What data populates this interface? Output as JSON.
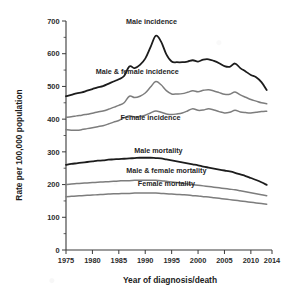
{
  "chart_data": {
    "type": "line",
    "title": "",
    "xlabel": "Year of diagnosis/death",
    "ylabel": "Rate per 100,000 population",
    "xlim": [
      1975,
      2014
    ],
    "ylim": [
      0,
      700
    ],
    "yticks": [
      0,
      100,
      200,
      300,
      400,
      500,
      600,
      700
    ],
    "ytick_minor_step": 50,
    "xticks": [
      1975,
      1980,
      1985,
      1990,
      1995,
      2000,
      2005,
      2010,
      2014
    ],
    "grid": false,
    "legend": "inline-annotations",
    "x": [
      1975,
      1976,
      1977,
      1978,
      1979,
      1980,
      1981,
      1982,
      1983,
      1984,
      1985,
      1986,
      1987,
      1988,
      1989,
      1990,
      1991,
      1992,
      1993,
      1994,
      1995,
      1996,
      1997,
      1998,
      1999,
      2000,
      2001,
      2002,
      2003,
      2004,
      2005,
      2006,
      2007,
      2008,
      2009,
      2010,
      2011,
      2012,
      2013
    ],
    "series": [
      {
        "name": "Male incidence",
        "color": "#1c1c1c",
        "width": 1.8,
        "label_x": 1991.2,
        "label_y": 690,
        "values": [
          470,
          474,
          479,
          482,
          487,
          492,
          497,
          501,
          508,
          515,
          522,
          532,
          561,
          556,
          566,
          585,
          620,
          655,
          637,
          598,
          576,
          574,
          574,
          576,
          580,
          576,
          582,
          583,
          578,
          571,
          562,
          560,
          570,
          556,
          546,
          535,
          528,
          513,
          489
        ]
      },
      {
        "name": "Male & female incidence",
        "color": "#7d7d7d",
        "width": 1.5,
        "label_x": 1988.5,
        "label_y": 537,
        "values": [
          406,
          407,
          410,
          412,
          415,
          418,
          422,
          425,
          430,
          436,
          442,
          450,
          470,
          466,
          470,
          480,
          498,
          515,
          505,
          487,
          477,
          477,
          478,
          482,
          487,
          484,
          488,
          490,
          486,
          481,
          476,
          476,
          483,
          474,
          467,
          460,
          455,
          450,
          447
        ]
      },
      {
        "name": "Female incidence",
        "color": "#7d7d7d",
        "width": 1.5,
        "label_x": 1991.0,
        "label_y": 398,
        "values": [
          368,
          366,
          366,
          368,
          371,
          374,
          377,
          380,
          385,
          391,
          396,
          404,
          410,
          407,
          408,
          412,
          419,
          425,
          421,
          416,
          414,
          416,
          419,
          425,
          432,
          427,
          428,
          432,
          428,
          423,
          419,
          421,
          427,
          422,
          420,
          419,
          421,
          423,
          424
        ]
      },
      {
        "name": "Male mortality",
        "color": "#1c1c1c",
        "width": 1.8,
        "label_x": 1992.5,
        "label_y": 298,
        "values": [
          260,
          263,
          265,
          267,
          269,
          271,
          273,
          274,
          276,
          277,
          278,
          279,
          280,
          281,
          282,
          282,
          282,
          281,
          280,
          277,
          274,
          271,
          268,
          265,
          262,
          259,
          255,
          252,
          249,
          246,
          243,
          240,
          236,
          231,
          226,
          220,
          214,
          207,
          199
        ]
      },
      {
        "name": "Male & female mortality",
        "color": "#7d7d7d",
        "width": 1.5,
        "label_x": 1994.0,
        "label_y": 236,
        "values": [
          200,
          202,
          203,
          204,
          205,
          206,
          207,
          208,
          209,
          210,
          211,
          212,
          212,
          213,
          213,
          213,
          213,
          213,
          212,
          210,
          208,
          206,
          204,
          202,
          200,
          198,
          196,
          194,
          192,
          190,
          188,
          186,
          184,
          181,
          178,
          175,
          172,
          169,
          166
        ]
      },
      {
        "name": "Female mortality",
        "color": "#7d7d7d",
        "width": 1.5,
        "label_x": 1994.0,
        "label_y": 196,
        "values": [
          163,
          164,
          165,
          166,
          167,
          168,
          169,
          170,
          171,
          172,
          172,
          173,
          173,
          174,
          174,
          174,
          174,
          174,
          173,
          172,
          171,
          170,
          169,
          168,
          166,
          165,
          163,
          162,
          160,
          158,
          156,
          154,
          152,
          150,
          148,
          146,
          144,
          142,
          140
        ]
      }
    ]
  }
}
